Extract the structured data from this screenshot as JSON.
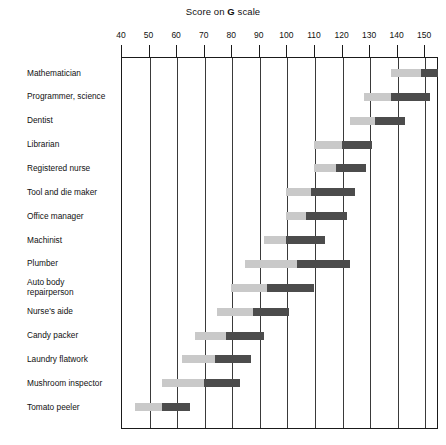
{
  "chart_title_prefix": "Score on ",
  "chart_title_emph": "G",
  "chart_title_suffix": " scale",
  "chart_data": {
    "type": "bar",
    "subtype": "range-bar",
    "title": "Score on G scale",
    "xlabel": "Score on G scale",
    "ylabel": "",
    "xlim": [
      40,
      155
    ],
    "xticks": [
      40,
      50,
      60,
      70,
      80,
      90,
      100,
      110,
      120,
      130,
      140,
      150
    ],
    "xticklabels": [
      "40",
      "50",
      "60",
      "70",
      "80",
      "90",
      "100",
      "110",
      "120",
      "130",
      "140",
      "150"
    ],
    "grid": true,
    "grid_axis": "x",
    "legend": "none",
    "colors": {
      "light_segment": "#c9c9c9",
      "dark_segment": "#4c4c4c",
      "frame": "#1a1a1a",
      "gridline": "#3a3a3a",
      "background": "#ffffff"
    },
    "categories": [
      "Mathematician",
      "Programmer, science",
      "Dentist",
      "Librarian",
      "Registered nurse",
      "Tool and die maker",
      "Office manager",
      "Machinist",
      "Plumber",
      "Auto body\nrepairperson",
      "Nurse's aide",
      "Candy packer",
      "Laundry flatwork",
      "Mushroom inspector",
      "Tomato peeler"
    ],
    "series": [
      {
        "name": "light range (lower band)",
        "color": "#c9c9c9",
        "starts": [
          138,
          128,
          123,
          110,
          110,
          100,
          100,
          92,
          85,
          80,
          75,
          67,
          62,
          55,
          45
        ]
      },
      {
        "name": "dark range (upper band)",
        "color": "#4c4c4c",
        "starts": [
          149,
          138,
          132,
          120,
          118,
          109,
          107,
          100,
          104,
          93,
          88,
          78,
          74,
          70,
          55
        ],
        "ends": [
          170,
          152,
          143,
          131,
          129,
          125,
          122,
          114,
          123,
          110,
          101,
          92,
          87,
          83,
          65
        ]
      }
    ],
    "bars": [
      {
        "label": "Mathematician",
        "light_start": 138,
        "dark_start": 149,
        "dark_end": 170
      },
      {
        "label": "Programmer, science",
        "light_start": 128,
        "dark_start": 138,
        "dark_end": 152
      },
      {
        "label": "Dentist",
        "light_start": 123,
        "dark_start": 132,
        "dark_end": 143
      },
      {
        "label": "Librarian",
        "light_start": 110,
        "dark_start": 120,
        "dark_end": 131
      },
      {
        "label": "Registered nurse",
        "light_start": 110,
        "dark_start": 118,
        "dark_end": 129
      },
      {
        "label": "Tool and die maker",
        "light_start": 100,
        "dark_start": 109,
        "dark_end": 125
      },
      {
        "label": "Office manager",
        "light_start": 100,
        "dark_start": 107,
        "dark_end": 122
      },
      {
        "label": "Machinist",
        "light_start": 92,
        "dark_start": 100,
        "dark_end": 114
      },
      {
        "label": "Plumber",
        "light_start": 85,
        "dark_start": 104,
        "dark_end": 123
      },
      {
        "label": "Auto body repairperson",
        "light_start": 80,
        "dark_start": 93,
        "dark_end": 110
      },
      {
        "label": "Nurse's aide",
        "light_start": 75,
        "dark_start": 88,
        "dark_end": 101
      },
      {
        "label": "Candy packer",
        "light_start": 67,
        "dark_start": 78,
        "dark_end": 92
      },
      {
        "label": "Laundry flatwork",
        "light_start": 62,
        "dark_start": 74,
        "dark_end": 87
      },
      {
        "label": "Mushroom inspector",
        "light_start": 55,
        "dark_start": 70,
        "dark_end": 83
      },
      {
        "label": "Tomato peeler",
        "light_start": 45,
        "dark_start": 55,
        "dark_end": 65
      }
    ]
  }
}
